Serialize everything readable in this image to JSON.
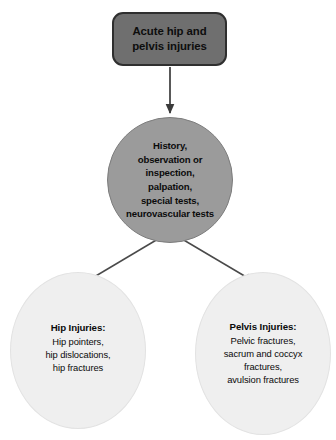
{
  "diagram": {
    "background_color": "#ffffff",
    "nodes": {
      "root": {
        "shape": "rounded-rectangle",
        "label": "Acute hip and\npelvis injuries",
        "fill_color": "#6f6f6f",
        "border_color": "#2f2f2f",
        "text_color": "#0d0d0d"
      },
      "assessment": {
        "shape": "circle",
        "label": "History,\nobservation or\ninspection,\npalpation,\nspecial tests,\nneurovascular tests",
        "fill_color": "#9b9b9b",
        "border_color": "#7d7d7d",
        "text_color": "#0b0b0b"
      },
      "hip_injuries": {
        "shape": "ellipse",
        "title": "Hip Injuries:",
        "body": "Hip pointers,\nhip dislocations,\nhip fractures",
        "fill_color": "#efefef",
        "border_color": "#e2e2e2",
        "text_color": "#0b0b0b"
      },
      "pelvis_injuries": {
        "shape": "ellipse",
        "title": "Pelvis Injuries:",
        "body": "Pelvic fractures,\nsacrum and coccyx\nfractures,\navulsion fractures",
        "fill_color": "#efefef",
        "border_color": "#e2e2e2",
        "text_color": "#0b0b0b"
      }
    },
    "edges": [
      {
        "name": "root-to-assessment",
        "from": "root",
        "to": "assessment",
        "style": "solid-arrow",
        "color": "#3b3b3b"
      },
      {
        "name": "assessment-to-hip-injuries",
        "from": "assessment",
        "to": "hip_injuries",
        "style": "solid-arrow",
        "color": "#4a4a4a"
      },
      {
        "name": "assessment-to-pelvis-injuries",
        "from": "assessment",
        "to": "pelvis_injuries",
        "style": "solid-arrow",
        "color": "#4a4a4a"
      }
    ]
  }
}
